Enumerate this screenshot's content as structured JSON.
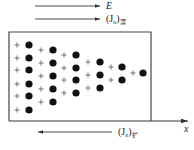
{
  "diagram": {
    "type": "semiconductor-carrier-distribution",
    "labels": {
      "field": "E",
      "drift_current_main": "(J",
      "drift_current_var": "n",
      "drift_current_close": ")",
      "drift_current_sub": "漂",
      "diffusion_current_main": "(J",
      "diffusion_current_var": "n",
      "diffusion_current_close": ")",
      "diffusion_current_sub": "扩",
      "axis": "x"
    },
    "arrows": {
      "field": {
        "direction": "right",
        "x1": 35,
        "x2": 100,
        "y": 6
      },
      "drift": {
        "direction": "right",
        "x1": 35,
        "x2": 100,
        "y": 19
      },
      "diffusion": {
        "direction": "left",
        "x1": 112,
        "x2": 38,
        "y": 132
      },
      "axis": {
        "direction": "right",
        "x1": 9,
        "x2": 188,
        "y": 121
      }
    },
    "box": {
      "x": 9,
      "y": 32,
      "width": 142,
      "height": 89
    },
    "columns": [
      {
        "plus_x": 17,
        "dot_x": 29,
        "rows": [
          45,
          58,
          70,
          84,
          96,
          110
        ]
      },
      {
        "plus_x": 41,
        "dot_x": 53,
        "rows": [
          50,
          63,
          76,
          89,
          102
        ]
      },
      {
        "plus_x": 64,
        "dot_x": 76,
        "rows": [
          55,
          68,
          80,
          93
        ]
      },
      {
        "plus_x": 88,
        "dot_x": 100,
        "rows": [
          62,
          75,
          88
        ]
      },
      {
        "plus_x": 111,
        "dot_x": 122,
        "rows": [
          67,
          80
        ]
      },
      {
        "plus_x": 133,
        "dot_x": 143,
        "rows": [
          73
        ]
      }
    ],
    "legend_meaning": {
      "plus": "ionized donor (fixed positive charge)",
      "dot": "electron"
    },
    "colors": {
      "line": "#333333",
      "dot": "#111111",
      "plus": "#555555",
      "box": "#444444"
    }
  }
}
